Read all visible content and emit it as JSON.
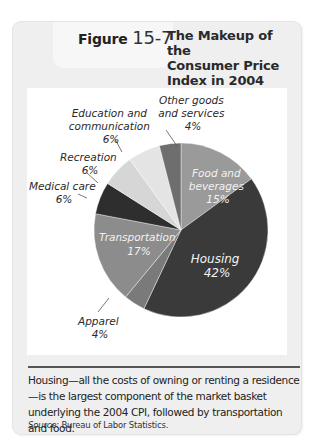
{
  "figure": {
    "label": "Figure",
    "number": "15-7",
    "title_lines": [
      "The Makeup of the",
      "Consumer Price",
      "Index in 2004"
    ]
  },
  "caption": {
    "text": "Housing—all the costs of owning or renting a residence—is the largest component of the market basket underlying the 2004 CPI, followed by transportation and food.",
    "source_label": "Source:",
    "source_text": "Bureau of Labor Statistics."
  },
  "chart_data": {
    "type": "pie",
    "title": "The Makeup of the Consumer Price Index in 2004",
    "unit": "%",
    "start_angle_deg": 0,
    "direction": "clockwise",
    "slices": [
      {
        "label": "Food and beverages",
        "value": 15,
        "display": "15%",
        "color": "#9a9a9a",
        "label_inside": true
      },
      {
        "label": "Housing",
        "value": 42,
        "display": "42%",
        "color": "#3a3a3a",
        "label_inside": true
      },
      {
        "label": "Apparel",
        "value": 4,
        "display": "4%",
        "color": "#7a7a7a",
        "label_inside": false
      },
      {
        "label": "Transportation",
        "value": 17,
        "display": "17%",
        "color": "#8c8c8c",
        "label_inside": true
      },
      {
        "label": "Medical care",
        "value": 6,
        "display": "6%",
        "color": "#2e2e2e",
        "label_inside": false
      },
      {
        "label": "Recreation",
        "value": 6,
        "display": "6%",
        "color": "#d6d6d6",
        "label_inside": false
      },
      {
        "label": "Education and communication",
        "value": 6,
        "display": "6%",
        "color": "#e4e4e4",
        "label_inside": false
      },
      {
        "label": "Other goods and services",
        "value": 4,
        "display": "4%",
        "color": "#6e6e6e",
        "label_inside": false
      }
    ],
    "legend": "none (callout labels)"
  },
  "labels": {
    "food": [
      "Food and",
      "beverages",
      "15%"
    ],
    "housing": [
      "Housing",
      "42%"
    ],
    "apparel": [
      "Apparel",
      "4%"
    ],
    "transportation": [
      "Transportation",
      "17%"
    ],
    "medical": [
      "Medical care",
      "6%"
    ],
    "recreation": [
      "Recreation",
      "6%"
    ],
    "education": [
      "Education and",
      "communication",
      "6%"
    ],
    "other": [
      "Other goods",
      "and services",
      "4%"
    ]
  }
}
